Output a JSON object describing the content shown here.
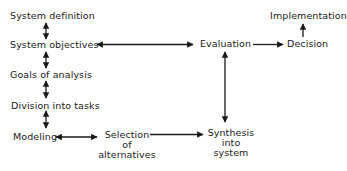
{
  "diagram": {
    "type": "flowchart",
    "nodes": {
      "system_definition": "System definition",
      "system_objectives": "System objectives",
      "goals_of_analysis": "Goals of analysis",
      "division_into_tasks": "Division into tasks",
      "modeling": "Modeling",
      "selection": [
        "Selection",
        "of",
        "alternatives"
      ],
      "synthesis": [
        "Synthesis",
        "into",
        "system"
      ],
      "evaluation": "Evaluation",
      "decision": "Decision",
      "implementation": "Implementation"
    },
    "edges": [
      {
        "from": "System definition",
        "to": "System objectives",
        "type": "bidirectional"
      },
      {
        "from": "System objectives",
        "to": "Goals of analysis",
        "type": "bidirectional"
      },
      {
        "from": "Goals of analysis",
        "to": "Division into tasks",
        "type": "bidirectional"
      },
      {
        "from": "Division into tasks",
        "to": "Modeling",
        "type": "bidirectional"
      },
      {
        "from": "Modeling",
        "to": "Selection of alternatives",
        "type": "bidirectional"
      },
      {
        "from": "Selection of alternatives",
        "to": "Synthesis into system",
        "type": "directed"
      },
      {
        "from": "Synthesis into system",
        "to": "Evaluation",
        "type": "bidirectional"
      },
      {
        "from": "System objectives",
        "to": "Evaluation",
        "type": "bidirectional"
      },
      {
        "from": "Evaluation",
        "to": "Decision",
        "type": "directed"
      },
      {
        "from": "Decision",
        "to": "Implementation",
        "type": "directed"
      }
    ],
    "colors": {
      "ink": "#1a1a1a",
      "background": "#ffffff"
    }
  }
}
